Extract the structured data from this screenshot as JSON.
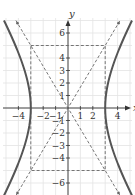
{
  "chart_data": {
    "type": "line",
    "title": "",
    "xlabel": "x",
    "ylabel": "y",
    "xlim": [
      -4.6,
      4.6
    ],
    "ylim": [
      -6.8,
      7
    ],
    "grid": true,
    "x_ticks": [
      -4,
      -2,
      -1,
      1,
      2,
      4
    ],
    "y_ticks": [
      6,
      4,
      3,
      2,
      1,
      -1,
      -2,
      -3,
      -4,
      -6
    ],
    "series": [
      {
        "name": "hyperbola",
        "equation": "x^2/9 - y^2/25 = 1",
        "style": "solid",
        "vertices": [
          [
            -3,
            0
          ],
          [
            3,
            0
          ]
        ]
      },
      {
        "name": "asymptote-1",
        "equation": "y = (5/3)x",
        "style": "dashed"
      },
      {
        "name": "asymptote-2",
        "equation": "y = -(5/3)x",
        "style": "dashed"
      },
      {
        "name": "central-rectangle",
        "corners": [
          [
            -3,
            5
          ],
          [
            3,
            5
          ],
          [
            3,
            -5
          ],
          [
            -3,
            -5
          ]
        ],
        "style": "dashed"
      }
    ]
  },
  "labels": {
    "x_axis": "x",
    "y_axis": "y",
    "x_ticks": [
      "−4",
      "−2",
      "−1",
      "1",
      "2",
      "4"
    ],
    "y_ticks": [
      "6",
      "4",
      "3",
      "2",
      "1",
      "−1",
      "−2",
      "−3",
      "−4",
      "−6"
    ]
  },
  "colors": {
    "curve": "#555555",
    "dashed": "#666666",
    "grid": "#e3e3e3",
    "axis": "#333333"
  }
}
